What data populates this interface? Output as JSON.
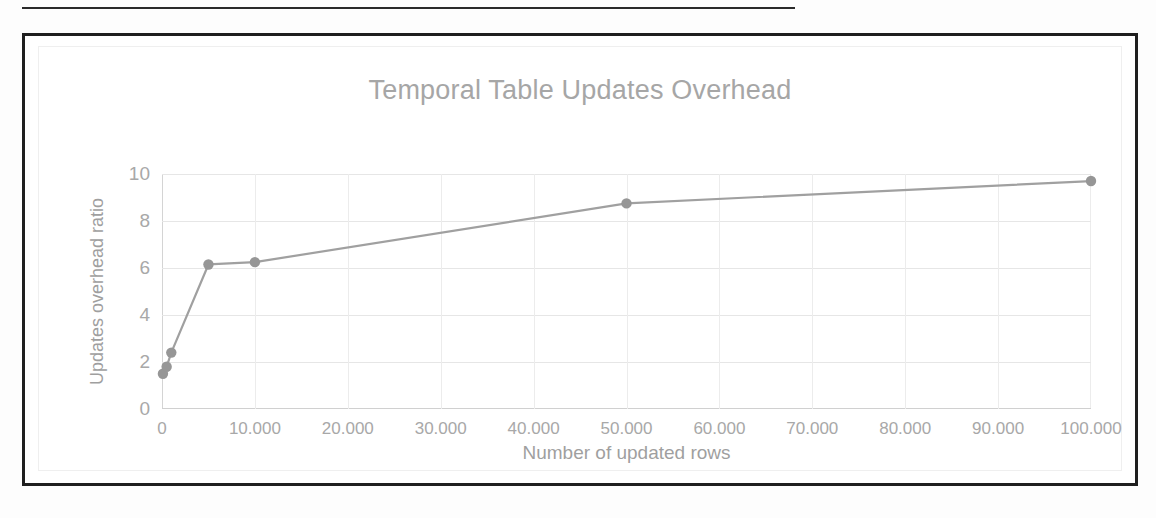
{
  "figure": {
    "has_top_rule": true,
    "frame_color": "#1f1f1f"
  },
  "chart_data": {
    "type": "line",
    "title": "Temporal Table Updates Overhead",
    "xlabel": "Number of updated rows",
    "ylabel": "Updates overhead ratio",
    "xlim": [
      0,
      100000
    ],
    "ylim": [
      0,
      10
    ],
    "grid": true,
    "legend": null,
    "marker": "circle",
    "line_color": "#a0a0a0",
    "marker_color": "#969696",
    "xtick_labels": [
      "0",
      "10.000",
      "20.000",
      "30.000",
      "40.000",
      "50.000",
      "60.000",
      "70.000",
      "80.000",
      "90.000",
      "100.000"
    ],
    "xtick_values": [
      0,
      10000,
      20000,
      30000,
      40000,
      50000,
      60000,
      70000,
      80000,
      90000,
      100000
    ],
    "ytick_labels": [
      "0",
      "2",
      "4",
      "6",
      "8",
      "10"
    ],
    "ytick_values": [
      0,
      2,
      4,
      6,
      8,
      10
    ],
    "x": [
      100,
      500,
      1000,
      5000,
      10000,
      50000,
      100000
    ],
    "values": [
      1.5,
      1.8,
      2.4,
      6.15,
      6.25,
      8.75,
      9.7
    ],
    "series": [
      {
        "name": "Updates overhead ratio",
        "points": [
          {
            "x": 100,
            "y": 1.5
          },
          {
            "x": 500,
            "y": 1.8
          },
          {
            "x": 1000,
            "y": 2.4
          },
          {
            "x": 5000,
            "y": 6.15
          },
          {
            "x": 10000,
            "y": 6.25
          },
          {
            "x": 50000,
            "y": 8.75
          },
          {
            "x": 100000,
            "y": 9.7
          }
        ]
      }
    ]
  }
}
